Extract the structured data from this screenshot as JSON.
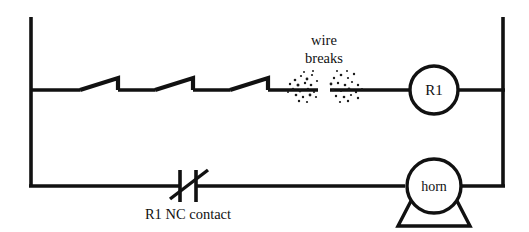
{
  "diagram": {
    "background_color": "#ffffff",
    "line_color": "#111111",
    "width": 529,
    "height": 232
  },
  "annotations": {
    "wire_break_line1": "wire",
    "wire_break_line2": "breaks",
    "contact_label": "R1  NC contact"
  },
  "devices": {
    "relay_coil": {
      "label": "R1",
      "shape": "circle"
    },
    "horn": {
      "label": "horn",
      "shape": "circle-with-trapezoid-base"
    }
  },
  "rungs": [
    {
      "name": "top-rung",
      "components": [
        "limit-switch-1",
        "limit-switch-2",
        "limit-switch-3",
        "wire-break-gap",
        "relay-coil-R1"
      ]
    },
    {
      "name": "bottom-rung",
      "components": [
        "R1-NC-contact",
        "horn"
      ]
    }
  ],
  "rails": {
    "left": "power-rail-left",
    "right": "power-rail-right"
  }
}
